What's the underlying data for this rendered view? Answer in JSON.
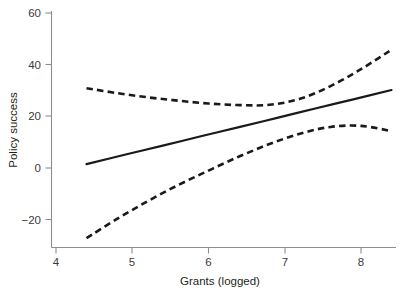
{
  "chart_data": {
    "type": "line",
    "title": "",
    "subtitle": "",
    "xlabel": "Grants (logged)",
    "ylabel": "Policy success",
    "xlim": [
      3.72,
      8.45
    ],
    "ylim": [
      -30.6,
      66.0
    ],
    "xticks": [
      4,
      5,
      6,
      7,
      8
    ],
    "xtick_labels": [
      "4",
      "5",
      "6",
      "7",
      "8"
    ],
    "yticks": [
      -20,
      0,
      20,
      40,
      60
    ],
    "ytick_labels": [
      "−20",
      "0",
      "20",
      "40",
      "60"
    ],
    "grid": false,
    "legend": false,
    "legend_position": "none",
    "annotations": [],
    "series": [
      {
        "name": "Predicted policy success (linear fit)",
        "style": "solid",
        "color": "#1a1a1a",
        "x": [
          4.4,
          4.9,
          5.4,
          5.9,
          6.4,
          6.9,
          7.4,
          7.9,
          8.4
        ],
        "values": [
          1.5,
          5.1,
          8.6,
          12.2,
          15.7,
          19.3,
          22.9,
          26.4,
          30.0
        ]
      },
      {
        "name": "Upper 95% confidence bound",
        "style": "dashed",
        "color": "#1a1a1a",
        "x": [
          4.4,
          4.8,
          5.2,
          5.6,
          6.0,
          6.4,
          6.8,
          7.2,
          7.6,
          8.0,
          8.4
        ],
        "values": [
          30.7,
          28.8,
          27.2,
          25.9,
          24.8,
          24.2,
          24.3,
          26.6,
          31.5,
          38.0,
          45.5
        ]
      },
      {
        "name": "Lower 95% confidence bound",
        "style": "dashed",
        "color": "#1a1a1a",
        "x": [
          4.4,
          4.8,
          5.2,
          5.6,
          6.0,
          6.4,
          6.8,
          7.2,
          7.6,
          8.0,
          8.4
        ],
        "values": [
          -27.0,
          -19.6,
          -12.8,
          -6.6,
          -1.0,
          4.4,
          9.2,
          13.2,
          15.8,
          16.2,
          14.2
        ]
      }
    ]
  },
  "axes": {
    "x_title": "Grants (logged)",
    "y_title": "Policy success",
    "x_tick_labels": [
      "4",
      "5",
      "6",
      "7",
      "8"
    ],
    "y_tick_labels": [
      "60",
      "40",
      "20",
      "0",
      "−20"
    ]
  }
}
